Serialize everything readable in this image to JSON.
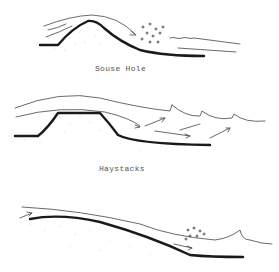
{
  "diagrams": [
    {
      "id": "souse-hole",
      "label": "Souse Hole"
    },
    {
      "id": "haystacks",
      "label": "Haystacks"
    },
    {
      "id": "wave-hole",
      "label": ""
    }
  ]
}
